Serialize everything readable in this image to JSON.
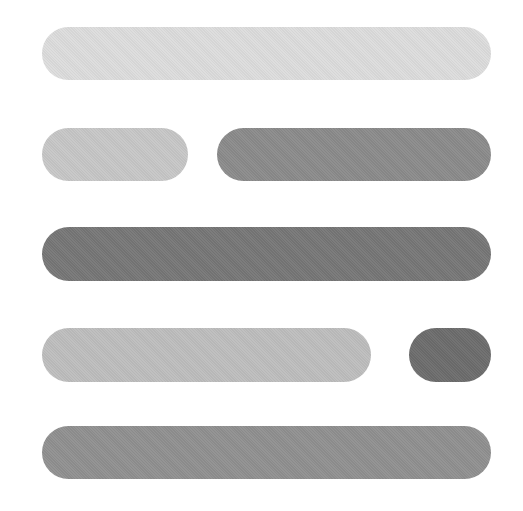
{
  "graphic": {
    "name": "text-lines-placeholder-icon",
    "rows": [
      {
        "pills": [
          {
            "name": "line-1",
            "x": 42,
            "y": 27,
            "w": 449,
            "h": 53,
            "color": "#dcdcdc"
          }
        ]
      },
      {
        "pills": [
          {
            "name": "line-2-short",
            "x": 42,
            "y": 128,
            "w": 146,
            "h": 53,
            "color": "#c6c6c6"
          },
          {
            "name": "line-2-long",
            "x": 217,
            "y": 128,
            "w": 274,
            "h": 53,
            "color": "#8a8a8a"
          }
        ]
      },
      {
        "pills": [
          {
            "name": "line-3",
            "x": 42,
            "y": 227,
            "w": 449,
            "h": 54,
            "color": "#767676"
          }
        ]
      },
      {
        "pills": [
          {
            "name": "line-4-long",
            "x": 42,
            "y": 328,
            "w": 329,
            "h": 54,
            "color": "#bdbdbd"
          },
          {
            "name": "line-4-dot",
            "x": 409,
            "y": 328,
            "w": 82,
            "h": 54,
            "color": "#6c6c6c"
          }
        ]
      },
      {
        "pills": [
          {
            "name": "line-5",
            "x": 42,
            "y": 426,
            "w": 449,
            "h": 53,
            "color": "#8f8f8f"
          }
        ]
      }
    ]
  }
}
